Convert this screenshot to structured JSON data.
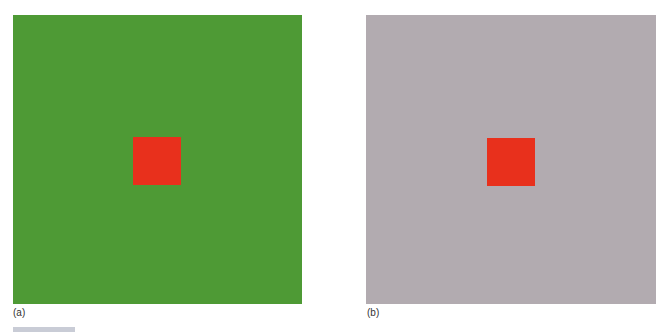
{
  "figure": {
    "panels": [
      {
        "label": "(a)",
        "background_color": "#4e9a35",
        "square_color": "#e8301c"
      },
      {
        "label": "(b)",
        "background_color": "#b2abb0",
        "square_color": "#e8301c"
      }
    ],
    "caption": ""
  }
}
